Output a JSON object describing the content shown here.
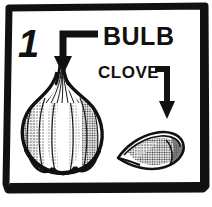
{
  "figure": {
    "step_number": "1",
    "background_color": "#ffffff",
    "ink_color": "#111111",
    "style": "hand-drawn black and white line illustration with halftone shading"
  },
  "border": {
    "name": "hand-drawn rectangular frame",
    "color": "#111111"
  },
  "labels": [
    {
      "id": "bulb",
      "text": "BULB",
      "arrow": {
        "name": "elbow-arrow-down",
        "direction": "left-then-down",
        "points_to": "garlic-bulb"
      }
    },
    {
      "id": "clove",
      "text": "CLOVE",
      "arrow": {
        "name": "elbow-arrow-down",
        "direction": "right-then-down",
        "points_to": "garlic-clove"
      }
    }
  ],
  "illustrations": [
    {
      "id": "garlic-bulb",
      "name": "garlic-bulb-illustration",
      "description": "whole garlic bulb with tapered neck and lobed body"
    },
    {
      "id": "garlic-clove",
      "name": "garlic-clove-illustration",
      "description": "single curved garlic clove with pointed tip"
    }
  ],
  "colors": {
    "ink": "#111111",
    "paper": "#ffffff",
    "shade_light": "#cfcfcf",
    "shade_mid": "#9a9a9a",
    "shade_dark": "#5a5a5a"
  }
}
